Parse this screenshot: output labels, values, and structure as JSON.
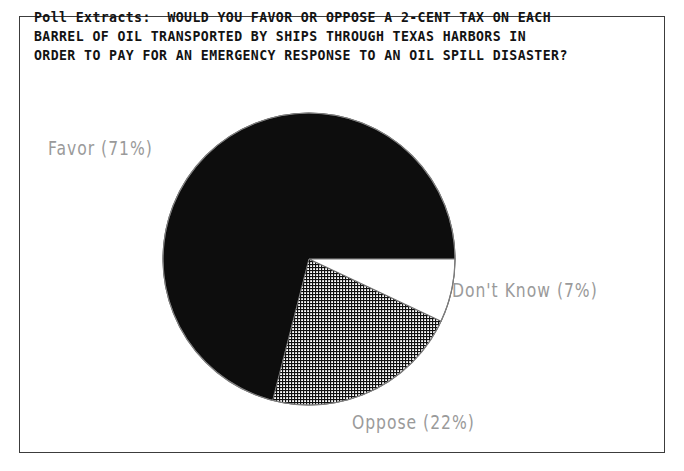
{
  "document": {
    "frame_color": "#3c3c3c",
    "background": "#ffffff"
  },
  "title": {
    "prefix": "Poll Extracts:",
    "line1": "Poll Extracts:  WOULD YOU FAVOR OR OPPOSE A 2-CENT TAX ON EACH",
    "line2": "BARREL OF OIL TRANSPORTED BY SHIPS THROUGH TEXAS HARBORS IN",
    "line3": "ORDER TO PAY FOR AN EMERGENCY RESPONSE TO AN OIL SPILL DISASTER?",
    "full": "Poll Extracts: WOULD YOU FAVOR OR OPPOSE A 2-CENT TAX ON EACH BARREL OF OIL TRANSPORTED BY SHIPS THROUGH TEXAS HARBORS IN ORDER TO PAY FOR AN EMERGENCY RESPONSE TO AN OIL SPILL DISASTER?"
  },
  "labels": {
    "favor": "Favor  (71%)",
    "dont_know": "Don't Know  (7%)",
    "oppose": "Oppose  (22%)"
  },
  "chart_data": {
    "type": "pie",
    "title": "Poll Extracts: WOULD YOU FAVOR OR OPPOSE A 2-CENT TAX ON EACH BARREL OF OIL TRANSPORTED BY SHIPS THROUGH TEXAS HARBORS IN ORDER TO PAY FOR AN EMERGENCY RESPONSE TO AN OIL SPILL DISASTER?",
    "xlabel": "",
    "ylabel": "",
    "categories": [
      "Favor",
      "Oppose",
      "Don't Know"
    ],
    "values": [
      71,
      22,
      7
    ],
    "unit": "%",
    "slices": [
      {
        "label": "Favor",
        "value": 71,
        "display": "Favor  (71%)",
        "fill": "solid-black",
        "color": "#0d0d0d",
        "start_angle_deg": 104.4,
        "end_angle_deg": 360.0
      },
      {
        "label": "Oppose",
        "value": 22,
        "display": "Oppose  (22%)",
        "fill": "cross-hatch",
        "color": "#7a7a7a",
        "start_angle_deg": 25.2,
        "end_angle_deg": 104.4
      },
      {
        "label": "Don't Know",
        "value": 7,
        "display": "Don't Know  (7%)",
        "fill": "white",
        "color": "#ffffff",
        "start_angle_deg": 0.0,
        "end_angle_deg": 25.2
      }
    ],
    "start_angle_deg": 0,
    "direction": "clockwise",
    "legend": "none",
    "labels_position": "outside",
    "grid": false,
    "center_px": [
      309,
      259
    ],
    "radius_px": 146
  }
}
